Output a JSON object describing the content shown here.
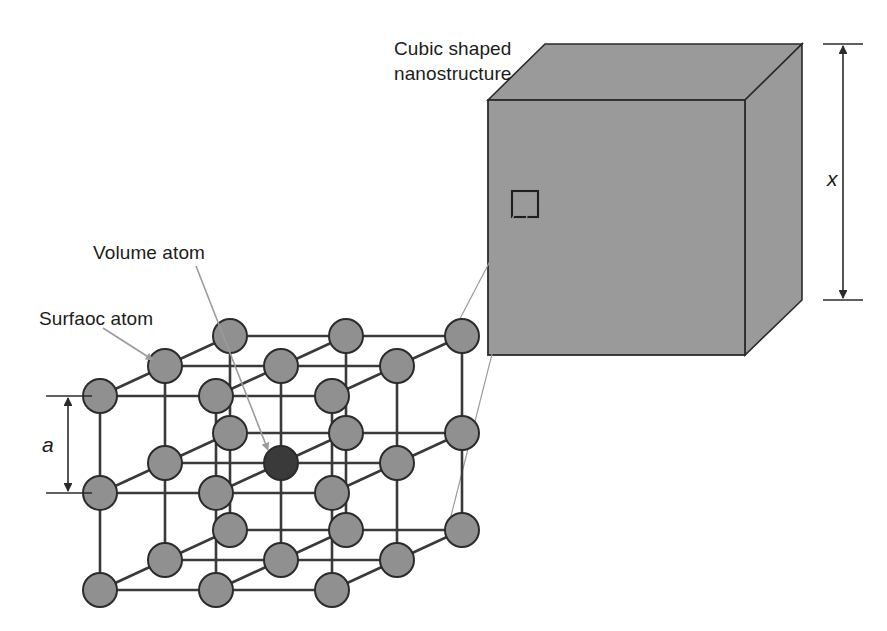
{
  "figure": {
    "background_color": "#ffffff"
  },
  "labels": {
    "cubic_nanostructure": "Cubic shaped\nnanostructure",
    "volume_atom": "Volume atom",
    "surface_atom": "Surfaoc atom",
    "dimension_cube_edge": "x",
    "dimension_lattice_spacing": "a"
  },
  "colors": {
    "cube_fill": "#9a9a9a",
    "cube_stroke": "#2b2b2b",
    "surface_atom_fill": "#909090",
    "volume_atom_fill": "#3a3a3a",
    "atom_stroke": "#2b2b2b",
    "bond_stroke": "#3a3a3a",
    "leader_line": "#9b9b9b",
    "dimension_line": "#2b2b2b",
    "text": "#1c1c1c"
  },
  "cube": {
    "projection": "oblique",
    "front_face": {
      "left": 488,
      "top": 100,
      "right": 745,
      "bottom": 355
    },
    "depth_offset": {
      "dx": 57,
      "dy": -56
    },
    "callout_square": {
      "x": 512,
      "y": 191,
      "size": 26
    }
  },
  "lattice": {
    "description": "3 x 3 x 3 simple cubic arrangement of atoms",
    "grid_size": 3,
    "origin": {
      "x": 100,
      "y": 590
    },
    "step_x": 116,
    "step_y": -97,
    "depth": {
      "dx": 65,
      "dy": -30
    },
    "atom_radius": 17,
    "volume_atom_index": {
      "i": 1,
      "j": 1,
      "k": 1
    }
  },
  "dimensions": {
    "cube_edge": {
      "x": 843,
      "y_top": 44,
      "y_bottom": 300,
      "tick_half_width": 20
    },
    "lattice_spacing": {
      "x": 68,
      "y_top": 396,
      "y_bottom": 493,
      "tick_half_width": 22
    }
  },
  "leader_lines": [
    {
      "from": [
        524,
        196
      ],
      "to": [
        452,
        334
      ],
      "name": "callout-to-lattice-top"
    },
    {
      "from": [
        528,
        212
      ],
      "to": [
        450,
        520
      ],
      "name": "callout-to-lattice-bottom"
    }
  ],
  "annotation_arrows": [
    {
      "name": "volume-atom-arrow",
      "from": [
        196,
        266
      ],
      "to": [
        268,
        452
      ]
    },
    {
      "name": "surface-atom-arrow",
      "from": [
        103,
        328
      ],
      "to": [
        155,
        362
      ]
    }
  ]
}
